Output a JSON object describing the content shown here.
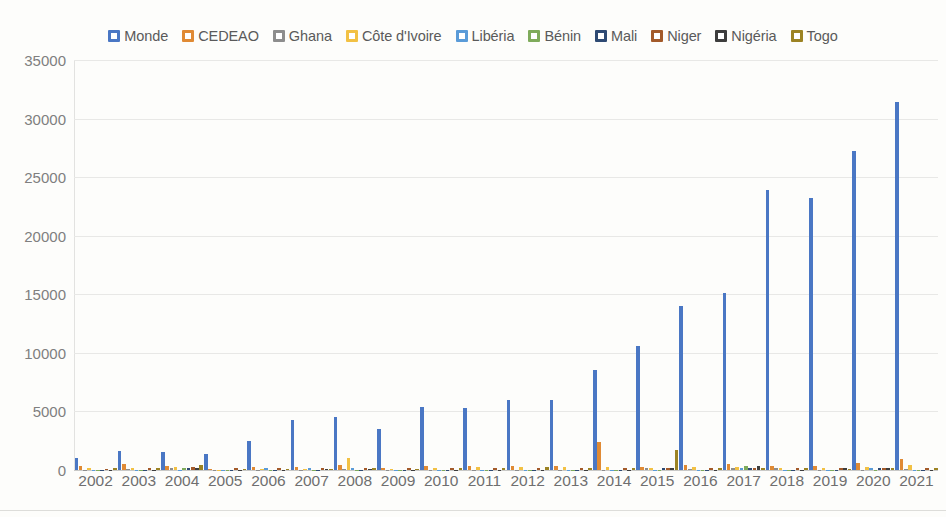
{
  "chart_data": {
    "type": "bar",
    "title": "",
    "subtitle": "",
    "xlabel": "",
    "ylabel": "",
    "ylim": [
      0,
      35000
    ],
    "ytick_step": 5000,
    "yticks": [
      "35000",
      "30000",
      "25000",
      "20000",
      "15000",
      "10000",
      "5000",
      "0"
    ],
    "grid": true,
    "legend_position": "top",
    "categories": [
      "2002",
      "2003",
      "2004",
      "2005",
      "2006",
      "2007",
      "2008",
      "2009",
      "2010",
      "2011",
      "2012",
      "2013",
      "2014",
      "2015",
      "2016",
      "2017",
      "2018",
      "2019",
      "2020",
      "2021"
    ],
    "series": [
      {
        "name": "Monde",
        "color": "#4a77c4",
        "values": [
          1000,
          1600,
          1500,
          1400,
          2500,
          4300,
          4500,
          3500,
          5400,
          5300,
          6000,
          6000,
          8500,
          10600,
          14000,
          15100,
          23900,
          23200,
          27200,
          31400
        ]
      },
      {
        "name": "CEDEAO",
        "color": "#e08a34",
        "values": [
          330,
          500,
          330,
          120,
          230,
          230,
          450,
          150,
          330,
          330,
          380,
          330,
          2400,
          300,
          430,
          480,
          330,
          330,
          600,
          900
        ]
      },
      {
        "name": "Ghana",
        "color": "#8d8d8d",
        "values": [
          30,
          60,
          130,
          30,
          30,
          30,
          60,
          30,
          30,
          30,
          30,
          30,
          30,
          130,
          60,
          160,
          130,
          30,
          30,
          60
        ]
      },
      {
        "name": "Côte d'Ivoire",
        "color": "#f2c144",
        "values": [
          200,
          200,
          230,
          30,
          60,
          60,
          1050,
          60,
          200,
          230,
          280,
          230,
          300,
          160,
          230,
          280,
          130,
          130,
          260,
          430
        ]
      },
      {
        "name": "Libéria",
        "color": "#5a9bd8",
        "values": [
          30,
          30,
          30,
          30,
          130,
          160,
          200,
          30,
          30,
          30,
          30,
          30,
          30,
          30,
          30,
          160,
          30,
          30,
          130,
          30
        ]
      },
      {
        "name": "Bénin",
        "color": "#7fab5b",
        "values": [
          30,
          30,
          130,
          30,
          30,
          30,
          30,
          30,
          30,
          30,
          30,
          30,
          30,
          30,
          30,
          330,
          30,
          30,
          30,
          30
        ]
      },
      {
        "name": "Mali",
        "color": "#2e4a73",
        "values": [
          30,
          30,
          130,
          30,
          30,
          30,
          30,
          30,
          30,
          30,
          30,
          30,
          30,
          160,
          30,
          130,
          30,
          30,
          130,
          30
        ]
      },
      {
        "name": "Niger",
        "color": "#a35a2a",
        "values": [
          60,
          160,
          230,
          130,
          160,
          200,
          200,
          200,
          130,
          160,
          160,
          160,
          160,
          130,
          130,
          200,
          160,
          160,
          160,
          130
        ]
      },
      {
        "name": "Nigéria",
        "color": "#3d3d3d",
        "values": [
          30,
          30,
          130,
          30,
          30,
          60,
          60,
          30,
          30,
          30,
          30,
          30,
          30,
          130,
          30,
          330,
          30,
          130,
          160,
          30
        ]
      },
      {
        "name": "Togo",
        "color": "#9c8323",
        "values": [
          130,
          200,
          430,
          60,
          60,
          60,
          130,
          60,
          160,
          200,
          230,
          200,
          200,
          1700,
          200,
          200,
          130,
          60,
          200,
          200
        ]
      }
    ]
  }
}
